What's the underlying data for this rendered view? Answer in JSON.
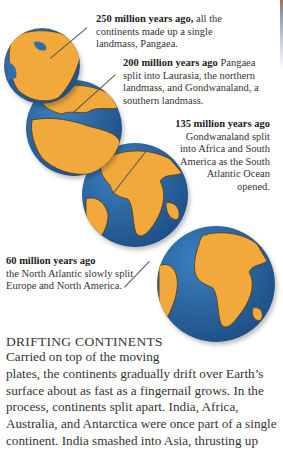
{
  "colors": {
    "ocean": "#2f6fae",
    "land": "#f0a93a",
    "land_shadow": "#d78a22",
    "leader": "#555555"
  },
  "globes": [
    {
      "label": "250 million years ago"
    },
    {
      "label": "200 million years ago"
    },
    {
      "label": "135 million years ago"
    },
    {
      "label": "60 million years ago"
    }
  ],
  "captions": [
    {
      "bold": "250 million years ago,",
      "text": " all the continents made up a single landmass, Pangaea."
    },
    {
      "bold": "200 million years ago",
      "text": " Pangaea split into Laurasia, the northern landmass, and Gondwanaland, a southern landmass."
    },
    {
      "bold": "135 million years ago",
      "text": " Gondwanaland split into Africa and South America as the South Atlantic Ocean opened."
    },
    {
      "bold": "60 million years ago",
      "text": " the North Atlantic slowly split Europe and North America."
    }
  ],
  "section": {
    "heading": "DRIFTING CONTINENTS",
    "body_first": "Carried on top of the moving",
    "body_rest": "plates, the continents gradually drift over Earth’s surface about as fast as a fingernail grows. In the process, continents split apart. India, Africa, Australia, and Antarctica were once part of a single continent. India smashed into Asia, thrusting up"
  }
}
